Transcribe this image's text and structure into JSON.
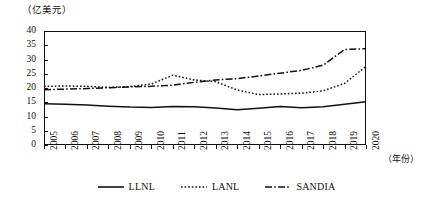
{
  "chart_data": {
    "type": "line",
    "title": "",
    "ylabel": "（亿美元）",
    "xlabel": "（年份）",
    "grid": false,
    "legend_position": "bottom",
    "ylim": [
      0,
      40
    ],
    "yticks": [
      0,
      5,
      10,
      15,
      20,
      25,
      30,
      35,
      40
    ],
    "categories": [
      "2005",
      "2006",
      "2007",
      "2008",
      "2009",
      "2010",
      "2011",
      "2012",
      "2013",
      "2014",
      "2015",
      "2016",
      "2017",
      "2018",
      "2019",
      "2020"
    ],
    "series": [
      {
        "name": "LLNL",
        "style": "solid",
        "color": "#111111",
        "values": [
          14.5,
          14.3,
          14.0,
          13.6,
          13.3,
          13.2,
          13.5,
          13.4,
          13.0,
          12.4,
          12.9,
          13.5,
          13.1,
          13.4,
          14.3,
          15.2
        ]
      },
      {
        "name": "LANL",
        "style": "dotted",
        "color": "#111111",
        "values": [
          20.6,
          20.7,
          20.6,
          20.2,
          20.5,
          21.4,
          24.5,
          22.8,
          22.2,
          19.3,
          17.7,
          17.9,
          18.2,
          19.0,
          21.6,
          27.6
        ]
      },
      {
        "name": "SANDIA",
        "style": "dashdot",
        "color": "#111111",
        "values": [
          19.4,
          19.6,
          19.8,
          20.1,
          20.4,
          20.6,
          21.0,
          22.0,
          22.8,
          23.3,
          24.2,
          25.2,
          26.2,
          28.0,
          33.5,
          33.8
        ]
      }
    ]
  },
  "legend": {
    "items": [
      {
        "label": "LLNL",
        "style": "solid"
      },
      {
        "label": "LANL",
        "style": "dotted"
      },
      {
        "label": "SANDIA",
        "style": "dashdot"
      }
    ]
  }
}
